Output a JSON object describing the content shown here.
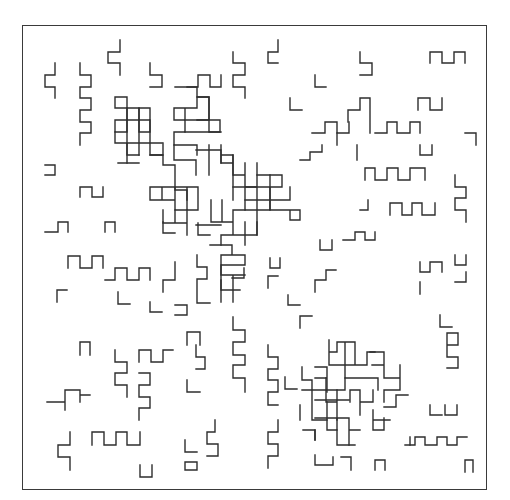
{
  "figure": {
    "type": "lattice-bond-pattern",
    "frame": {
      "x": 22,
      "y": 25,
      "width": 465,
      "height": 465
    },
    "stroke_color": "#2e2e2e",
    "frame_color": "#3a3a3a",
    "background": "#ffffff",
    "grid_pitch_px": 11.7,
    "paths": [
      "M120,40 V52 H108 V63 H120 V75",
      "M55,63 V75 H45 V87 H55 V98",
      "M80,63 V75 H91 V87 H80 V98 H91 V110 H80 V122 H91 V133 H80 V145",
      "M150,63 V75 H162 V87 H150",
      "M187,87 H198 V75 H210 V87 H221 V75",
      "M233,52 V63 H245 V75 H233 V87 H245 V98",
      "M278,40 V52 H268 V63 H278",
      "M360,52 V63 H372 V75 H360",
      "M315,75 V87 H326",
      "M290,98 V110 H302",
      "M430,63 V52 H442 V63 H454 V52 H465 V63",
      "M418,110 V98 H430 V110 H442 V98",
      "M312,133 H325 V122 H337 V133 H349 V122",
      "M337,145 V133",
      "M370,133 V98 H360 V110 H348 V122",
      "M375,133 H387 V122 H397 V133 H410 V122 H420 V133",
      "M465,133 H476 V145",
      "M420,145 V155 H432 V145",
      "M357,160 V145",
      "M300,160 H310 V152 H322 V145",
      "M365,180 V168 H375 V180 H387 V168 H398 V180 H410 V168 H425 V180",
      "M360,210 H368 V200",
      "M390,215 V203 H402 V215 H412 V203 H422 V215 H435 V203",
      "M455,175 V187 H466 V198 H455 V210 H466 V222",
      "M320,240 V250 H332 V240",
      "M343,240 H355 V232 H365 V240 H375 V232",
      "M45,165 H55 V175 H45",
      "M80,197 V187 H92 V197 H103 V187",
      "M45,232 H58 V222 H68 V232",
      "M105,232 V222 H115 V232",
      "M68,268 V256 H80 V268 H92 V256 H103 V268",
      "M105,280 H115 V268 H127 V280 H139 V268 H150 V280",
      "M57,302 V290 H67",
      "M118,292 V304 H130",
      "M150,302 V312 H162",
      "M163,292 V280 H175 V262",
      "M175,315 H187 V305 H175",
      "M197,255 V267 H207 V279 H197 V303 H210",
      "M80,355 V342 H90 V355",
      "M115,350 V362 H127 V373 H115 V385 H127 V397",
      "M139,362 V350 H151 V362 H163 V350 H173",
      "M139,373 H150 V385 H139 V397 H150 V408 H139 V420",
      "M187,345 V332 H200 V345",
      "M196,345 V357 H205 V369 H196",
      "M233,317 V330 H245 V342 H233 V355 H245 V365 H233 V378 H245 V392",
      "M187,380 V392 H200",
      "M65,410 V402 H47 M65,402 V390 H80 V402 M80,395 H90",
      "M92,445 V432 H104 V445 H116 V432 H127 V445 H140 V432",
      "M70,432 V445 H58 V457 H70 V470",
      "M140,465 V477 H152 V465",
      "M185,440 V452 H197",
      "M185,462 H197 V470 M185,462 V470 H197",
      "M215,420 V432 H207 V444 H218 V456 H207",
      "M270,258 V268 H280 V258",
      "M288,295 V305 H300",
      "M268,288 V276 H278",
      "M300,328 V316 H312",
      "M268,345 V357 H278 V369 H268 V380 H278 V392 H268 V405 H278",
      "M285,377 V389 H297",
      "M315,292 V280 H326 V270 M326,270 H336",
      "M232,278 H244 V268",
      "M278,420 V432 H268 V444 H278 V456 H268 V468",
      "M315,455 V465 H333 V457 M341,457 H351 V470",
      "M375,470 V460 H385 V470",
      "M384,407 H396 V395 H408",
      "M405,445 H415 V437 H425 V445 H437 V437 H447 V445 H457 V437 H467",
      "M410,437 V445",
      "M430,405 V415 H442",
      "M445,405 V415 H457 V405",
      "M447,345 V333 H458 V345 H447 V357 H458 V368 H447",
      "M440,315 V327 H452",
      "M455,255 V265 H466 V255",
      "M420,262 V272 H430 V262 H442 V272",
      "M420,282 V294",
      "M455,282 H466 V272",
      "M465,460 H473 V472 M465,460 V472"
    ],
    "clusters": [
      {
        "name": "cluster-upper-left",
        "paths": [
          "M115,97 H127 V108 H139 M115,97 V108 H127 V120 H115 V132 H127 V120 H139 V132 H150 V120 H139 V108 H150 V120",
          "M127,108 V163 M139,108 V155 M150,120 V155 M163,143 V155 H150",
          "M115,132 V143 H162 M127,143 V155 H139 M118,163 H139",
          "M150,155 H163 V165 H175 V178 M175,178 V190 H187 V200",
          "M175,87 H197 V97 M174,108 H197 V97 H209 V108 M174,108 V120 H185 V132 H174 V145 H197 V155 M185,108 V120 M197,120 H209 V132 H220 V120 H209 V108",
          "M197,97 H209 V120 M185,132 H221 M185,120 H209",
          "M174,145 V160 H196 V175 M196,150 H221 V163 M209,145 V175 M221,155 H233 V175",
          "M150,187 V200 H175 V187 H150 M162,187 V200 M175,187 H198 V210 H175 V200 M187,187 V210",
          "M163,210 V223 H187 V210 M175,210 V223 M187,223 V235 M198,223 V235 H210",
          "M163,222 V233 H175 M196,225 H221"
        ]
      },
      {
        "name": "cluster-center",
        "paths": [
          "M221,145 V163 H233 V175 H245 V187 H257 M233,155 V200 M245,163 V210 H270 V175 M257,163 V235",
          "M257,175 H282 V187 H270 M233,187 H270 M245,200 H290 V187 M270,187 V210 H290 V220 H300 V210 H290",
          "M211,200 V222 H233 V210 H245 M222,200 V222 M233,222 V235 M222,235 H257 V222 M221,235 V245 M245,222 V245",
          "M210,245 H232 V255 H221 V265 H245 V255 H232 M232,245 V255 M221,255 V290",
          "M221,265 V275 H233 V290 M233,275 H245 M221,290 H240 M233,290 V302 M221,302 V280"
        ]
      },
      {
        "name": "cluster-lower-right",
        "paths": [
          "M329,340 V352 H337 M329,352 V365 H367 V352 H375 M337,352 V342 H355 V365 M345,342 V378 H378 V390",
          "M315,367 H327 V392 M302,367 V380 H312 M315,378 H327 M302,390 H345 V378 M312,380 V420 H327",
          "M326,378 V402 H337 V390 M337,402 V420 M350,402 V390 H360 V402 H373 V390 M360,390 V415",
          "M315,400 H349 M327,402 V430 H337 V418 M315,418 H349 V430 H360 M315,430 V440 M349,430 V445",
          "M300,405 V420 M303,430 H315 V440 M337,430 V445 H355",
          "M370,352 H384 V365 H372 M384,365 V378 H400 V390 H384 V402 M400,378 V365",
          "M373,410 V430 H384 V418 M373,420 H390"
        ]
      }
    ]
  }
}
